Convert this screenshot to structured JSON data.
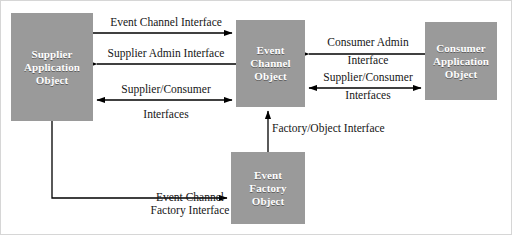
{
  "diagram": {
    "type": "block-diagram",
    "background_color": "#ffffff",
    "node_fill_color": "#9a9a9a",
    "node_text_color": "#ffffff",
    "line_color": "#000000",
    "border_color": "#c9c9c9",
    "nodes": [
      {
        "id": "supplier-application-object",
        "lines": [
          "Supplier",
          "Application",
          "Object"
        ]
      },
      {
        "id": "event-channel-object",
        "lines": [
          "Event",
          "Channel",
          "Object"
        ]
      },
      {
        "id": "consumer-application-object",
        "lines": [
          "Consumer",
          "Application",
          "Object"
        ]
      },
      {
        "id": "event-factory-object",
        "lines": [
          "Event",
          "Factory",
          "Object"
        ]
      }
    ],
    "edges": [
      {
        "id": "event-channel-interface",
        "lines": [
          "Event Channel Interface"
        ],
        "from": "supplier-application-object",
        "to": "event-channel-object",
        "direction": "right"
      },
      {
        "id": "supplier-admin-interface",
        "lines": [
          "Supplier Admin Interface"
        ],
        "from": "event-channel-object",
        "to": "supplier-application-object",
        "direction": "left"
      },
      {
        "id": "supplier-consumer-interfaces-left",
        "lines": [
          "Supplier/Consumer",
          "Interfaces"
        ],
        "from": "supplier-application-object",
        "to": "event-channel-object",
        "direction": "both"
      },
      {
        "id": "consumer-admin-interface",
        "lines": [
          "Consumer Admin",
          "Interface"
        ],
        "from": "consumer-application-object",
        "to": "event-channel-object",
        "direction": "left"
      },
      {
        "id": "supplier-consumer-interfaces-right",
        "lines": [
          "Supplier/Consumer",
          "Interfaces"
        ],
        "from": "event-channel-object",
        "to": "consumer-application-object",
        "direction": "both"
      },
      {
        "id": "factory-object-interface",
        "lines": [
          "Factory/Object Interface"
        ],
        "from": "event-factory-object",
        "to": "event-channel-object",
        "direction": "up"
      },
      {
        "id": "event-channel-factory-interface",
        "lines": [
          "Event Channel",
          "Factory Interface"
        ],
        "from": "supplier-application-object",
        "to": "event-factory-object",
        "direction": "right"
      }
    ]
  }
}
